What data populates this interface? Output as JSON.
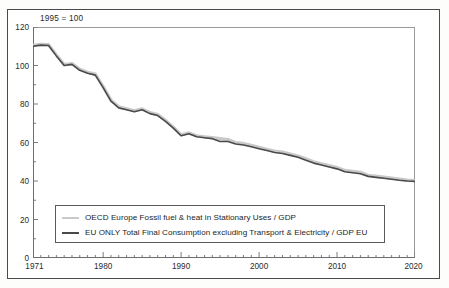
{
  "annotation": "1995 = 100",
  "legend": {
    "items": [
      {
        "label": "OECD Europe Fossil fuel & heat in Stationary Uses / GDP",
        "swatch": "light-gray-line",
        "color": "#c9c9c9"
      },
      {
        "label": "EU ONLY Total Final Consumption excluding Transport & Electricity / GDP EU",
        "swatch": "dark-gray-line",
        "color": "#4a4a4a"
      }
    ]
  },
  "axes": {
    "y_ticks": [
      "0",
      "20",
      "40",
      "60",
      "80",
      "100",
      "120"
    ],
    "x_ticks": [
      "1971",
      "1980",
      "1990",
      "2000",
      "2010",
      "2020"
    ]
  },
  "chart_data": {
    "type": "line",
    "title": "",
    "subtitle": "",
    "annotation": "1995 = 100",
    "xlabel": "",
    "ylabel": "",
    "xlim": [
      1971,
      2020
    ],
    "ylim": [
      0,
      120
    ],
    "ytick_step": 20,
    "yminor_step": 10,
    "xtick_major": [
      1971,
      1980,
      1990,
      2000,
      2010,
      2020
    ],
    "xminor_step": 1,
    "grid": false,
    "legend_position": "lower-center-inside",
    "x": [
      1971,
      1972,
      1973,
      1974,
      1975,
      1976,
      1977,
      1978,
      1979,
      1980,
      1981,
      1982,
      1983,
      1984,
      1985,
      1986,
      1987,
      1988,
      1989,
      1990,
      1991,
      1992,
      1993,
      1994,
      1995,
      1996,
      1997,
      1998,
      1999,
      2000,
      2001,
      2002,
      2003,
      2004,
      2005,
      2006,
      2007,
      2008,
      2009,
      2010,
      2011,
      2012,
      2013,
      2014,
      2015,
      2016,
      2017,
      2018,
      2019,
      2020
    ],
    "series": [
      {
        "name": "OECD Europe Fossil fuel & heat in Stationary Uses / GDP",
        "color": "#c9c9c9",
        "values": [
          110.5,
          111.0,
          110.8,
          105.5,
          100.5,
          101.0,
          98.0,
          96.5,
          95.5,
          89.0,
          82.0,
          78.5,
          77.5,
          76.5,
          77.5,
          75.5,
          74.5,
          71.5,
          68.0,
          64.0,
          65.0,
          63.5,
          63.0,
          62.5,
          62.0,
          61.5,
          60.0,
          59.5,
          58.5,
          57.5,
          56.5,
          55.5,
          55.0,
          54.0,
          53.0,
          51.5,
          50.0,
          49.0,
          48.0,
          47.0,
          45.5,
          45.0,
          44.5,
          43.0,
          42.5,
          42.0,
          41.5,
          41.0,
          40.5,
          40.3
        ]
      },
      {
        "name": "EU ONLY Total Final Consumption excluding Transport & Electricity / GDP EU",
        "color": "#4a4a4a",
        "values": [
          110.0,
          110.6,
          110.4,
          105.0,
          100.0,
          100.6,
          97.5,
          96.0,
          95.0,
          88.5,
          81.5,
          78.0,
          77.0,
          76.0,
          77.0,
          75.0,
          74.0,
          71.0,
          67.5,
          63.5,
          64.5,
          63.0,
          62.5,
          62.0,
          60.5,
          60.5,
          59.2,
          58.7,
          57.8,
          56.8,
          55.8,
          54.8,
          54.3,
          53.3,
          52.3,
          50.8,
          49.3,
          48.3,
          47.3,
          46.3,
          44.8,
          44.3,
          43.8,
          42.4,
          41.9,
          41.4,
          40.9,
          40.4,
          40.0,
          39.8
        ]
      }
    ]
  }
}
